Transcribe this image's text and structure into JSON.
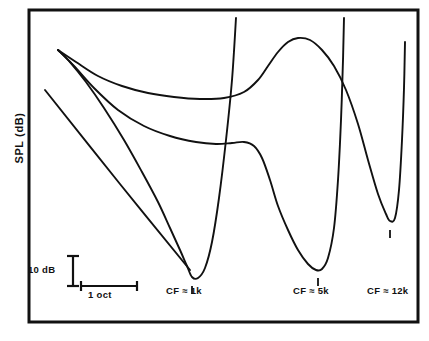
{
  "figure": {
    "axis": {
      "y_label": "SPL (dB)",
      "x_label": ""
    },
    "scale_bars": {
      "vertical_label": "10 dB",
      "horizontal_label": "1 oct"
    },
    "cf_labels": [
      {
        "id": "cf-1k",
        "text": "CF ≈ 1k"
      },
      {
        "id": "cf-5k",
        "text": "CF ≈ 5k"
      },
      {
        "id": "cf-12k",
        "text": "CF ≈ 12k"
      }
    ],
    "colors": {
      "line": "#111111",
      "frame": "#111111",
      "background": "#ffffff"
    }
  },
  "chart_data": {
    "type": "line",
    "title": "",
    "subtitle": "",
    "xlabel": "",
    "ylabel": "SPL (dB)",
    "axis_ticks": "none",
    "grid": false,
    "legend": "none",
    "xlim": [
      29,
      418
    ],
    "ylim": [
      10,
      322
    ],
    "y_direction": "increasing SPL upward; curve minima = lowest threshold",
    "series": [
      {
        "name": "Tuning curve CF ≈ 1k",
        "cf_label": "CF ≈ 1k",
        "cf_tick_x": 192,
        "minimum": {
          "x": 192,
          "y": 278
        },
        "points": [
          [
            58,
            50
          ],
          [
            70,
            62
          ],
          [
            86,
            82
          ],
          [
            104,
            108
          ],
          [
            124,
            140
          ],
          [
            142,
            172
          ],
          [
            158,
            202
          ],
          [
            170,
            228
          ],
          [
            180,
            250
          ],
          [
            187,
            266
          ],
          [
            192,
            277
          ],
          [
            198,
            278
          ],
          [
            205,
            268
          ],
          [
            212,
            242
          ],
          [
            219,
            198
          ],
          [
            226,
            140
          ],
          [
            232,
            80
          ],
          [
            236,
            18
          ]
        ]
      },
      {
        "name": "Tuning curve CF ≈ 5k",
        "cf_label": "CF ≈ 5k",
        "cf_tick_x": 318,
        "minimum": {
          "x": 318,
          "y": 270
        },
        "points": [
          [
            58,
            50
          ],
          [
            74,
            66
          ],
          [
            94,
            88
          ],
          [
            118,
            110
          ],
          [
            144,
            126
          ],
          [
            170,
            136
          ],
          [
            196,
            142
          ],
          [
            216,
            144
          ],
          [
            232,
            143
          ],
          [
            244,
            142
          ],
          [
            254,
            146
          ],
          [
            262,
            158
          ],
          [
            270,
            180
          ],
          [
            278,
            206
          ],
          [
            288,
            230
          ],
          [
            298,
            250
          ],
          [
            308,
            264
          ],
          [
            316,
            270
          ],
          [
            322,
            269
          ],
          [
            328,
            258
          ],
          [
            334,
            228
          ],
          [
            338,
            180
          ],
          [
            341,
            120
          ],
          [
            343,
            60
          ],
          [
            344,
            18
          ]
        ]
      },
      {
        "name": "Tuning curve CF ≈ 12k",
        "cf_label": "CF ≈ 12k",
        "cf_tick_x": 390,
        "minimum": {
          "x": 390,
          "y": 222
        },
        "points": [
          [
            58,
            50
          ],
          [
            76,
            62
          ],
          [
            98,
            76
          ],
          [
            122,
            86
          ],
          [
            148,
            93
          ],
          [
            174,
            97
          ],
          [
            200,
            99
          ],
          [
            224,
            98
          ],
          [
            244,
            92
          ],
          [
            258,
            80
          ],
          [
            268,
            66
          ],
          [
            278,
            52
          ],
          [
            288,
            42
          ],
          [
            298,
            38
          ],
          [
            310,
            40
          ],
          [
            322,
            50
          ],
          [
            334,
            66
          ],
          [
            346,
            90
          ],
          [
            358,
            124
          ],
          [
            368,
            160
          ],
          [
            378,
            194
          ],
          [
            386,
            214
          ],
          [
            390,
            221
          ],
          [
            395,
            218
          ],
          [
            399,
            190
          ],
          [
            402,
            140
          ],
          [
            404,
            88
          ],
          [
            405,
            42
          ]
        ]
      },
      {
        "name": "Straight reference line",
        "cf_label": "",
        "points": [
          [
            45,
            90
          ],
          [
            120,
            184
          ],
          [
            190,
            270
          ]
        ]
      }
    ]
  }
}
